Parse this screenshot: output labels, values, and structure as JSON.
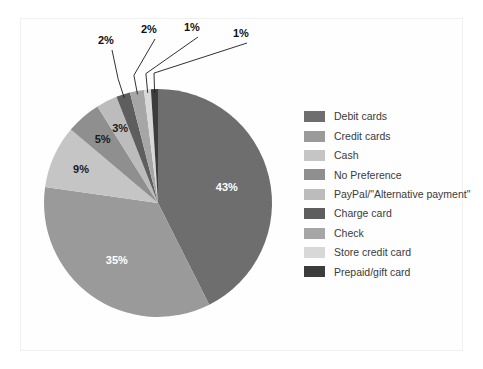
{
  "chart_data": {
    "type": "pie",
    "title": "",
    "categories": [
      "Debit cards",
      "Credit cards",
      "Cash",
      "No Preference",
      "PayPal/\"Alternative payment\"",
      "Charge card",
      "Check",
      "Store credit card",
      "Prepaid/gift card"
    ],
    "values": [
      43,
      35,
      9,
      5,
      3,
      2,
      2,
      1,
      1
    ],
    "value_labels": [
      "43%",
      "35%",
      "9%",
      "5%",
      "3%",
      "2%",
      "2%",
      "1%",
      "1%"
    ],
    "colors": [
      "#6e6e6e",
      "#9a9a9a",
      "#c5c5c5",
      "#8f8f8f",
      "#bcbcbc",
      "#5e5e5e",
      "#a6a6a6",
      "#d8d8d8",
      "#3c3c3c"
    ],
    "label_placement": [
      "inside",
      "inside",
      "inside",
      "inside",
      "inside",
      "callout",
      "callout",
      "callout",
      "callout"
    ],
    "legend_position": "right",
    "grid": false,
    "start_angle_deg": 0,
    "direction": "clockwise",
    "xlabel": "",
    "ylabel": ""
  },
  "legend": {
    "items": [
      {
        "label": "Debit cards",
        "color": "#6e6e6e"
      },
      {
        "label": "Credit cards",
        "color": "#9a9a9a"
      },
      {
        "label": "Cash",
        "color": "#c5c5c5"
      },
      {
        "label": "No Preference",
        "color": "#8f8f8f"
      },
      {
        "label": "PayPal/\"Alternative payment\"",
        "color": "#bcbcbc"
      },
      {
        "label": "Charge card",
        "color": "#5e5e5e"
      },
      {
        "label": "Check",
        "color": "#a6a6a6"
      },
      {
        "label": "Store credit card",
        "color": "#d8d8d8"
      },
      {
        "label": "Prepaid/gift card",
        "color": "#3c3c3c"
      }
    ]
  }
}
